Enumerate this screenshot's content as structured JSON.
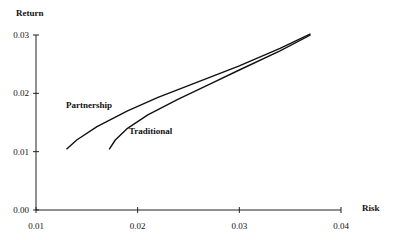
{
  "chart_data": {
    "type": "line",
    "title": "",
    "xlabel": "Risk",
    "ylabel": "Return",
    "xlim": [
      0.01,
      0.04
    ],
    "ylim": [
      0.0,
      0.03
    ],
    "xticks": [
      "0.01",
      "0.02",
      "0.03",
      "0.04"
    ],
    "yticks": [
      "0.00",
      "0.01",
      "0.02",
      "0.03"
    ],
    "grid": false,
    "legend": "inline labels",
    "series": [
      {
        "name": "Partnership",
        "x": [
          0.013,
          0.014,
          0.016,
          0.019,
          0.022,
          0.026,
          0.03,
          0.034,
          0.037
        ],
        "y": [
          0.0104,
          0.012,
          0.0143,
          0.017,
          0.0193,
          0.022,
          0.0247,
          0.0277,
          0.0302
        ]
      },
      {
        "name": "Traditional",
        "x": [
          0.0172,
          0.0178,
          0.019,
          0.021,
          0.024,
          0.027,
          0.03,
          0.034,
          0.037
        ],
        "y": [
          0.0104,
          0.012,
          0.014,
          0.0163,
          0.019,
          0.0215,
          0.024,
          0.0273,
          0.03
        ]
      }
    ]
  },
  "labels": {
    "ylabel": "Return",
    "xlabel": "Risk",
    "partnership": "Partnership",
    "traditional": "Traditional"
  }
}
